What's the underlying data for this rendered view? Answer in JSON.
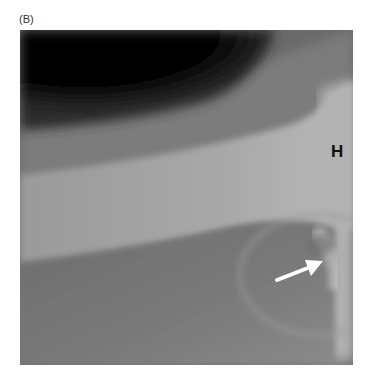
{
  "figure": {
    "panel_label": "(B)",
    "image_type": "radiograph",
    "annotations": {
      "letter_marker": "H",
      "arrow": "white arrow pointing up-right"
    },
    "colors": {
      "background": "#ffffff",
      "soft_tissue_dark": "#050505",
      "bone": "#b8b8b8",
      "arrow": "#ffffff"
    }
  }
}
